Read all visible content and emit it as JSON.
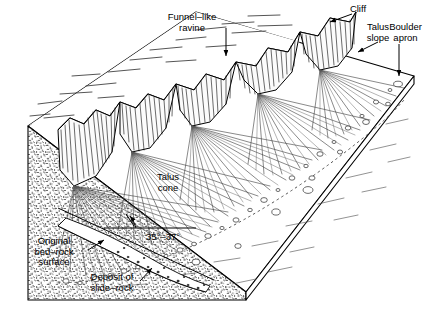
{
  "figure": {
    "kind": "geological-block-diagram",
    "ink_color": "#1a1a1a",
    "paper_color": "#ffffff"
  },
  "labels": {
    "cliff": "Cliff",
    "funnel_like_ravine": "Funnel–like\nravine",
    "talus_slope": "Talus\nslope",
    "boulder_apron": "Boulder\napron",
    "talus_cone": "Talus\ncone",
    "angle": "35°–37°",
    "original_bedrock_surface": "Original\nbed–rock\nsurface",
    "deposit_of_slide_rock": "Deposit of\nslide–rock"
  },
  "annotations": [
    {
      "name": "cliff",
      "text": "Cliff",
      "x": 355,
      "y": 8,
      "leader": true
    },
    {
      "name": "funnel-like-ravine",
      "text": "Funnel–like ravine",
      "x": 185,
      "y": 14,
      "leader": true
    },
    {
      "name": "talus-slope",
      "text": "Talus slope",
      "x": 378,
      "y": 28,
      "leader": true
    },
    {
      "name": "boulder-apron",
      "text": "Boulder apron",
      "x": 412,
      "y": 32,
      "leader": true
    },
    {
      "name": "talus-cone",
      "text": "Talus cone",
      "x": 170,
      "y": 178,
      "leader": false
    },
    {
      "name": "slope-angle",
      "text": "35°–37°",
      "x": 152,
      "y": 238,
      "leader": false
    },
    {
      "name": "original-bedrock-surface",
      "text": "Original bed–rock surface",
      "x": 52,
      "y": 245,
      "leader": true
    },
    {
      "name": "deposit-of-slide-rock",
      "text": "Deposit of slide–rock",
      "x": 108,
      "y": 280,
      "leader": true
    }
  ]
}
